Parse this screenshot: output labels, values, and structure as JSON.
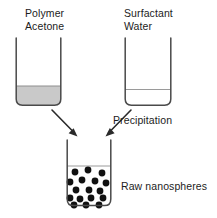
{
  "diagram": {
    "type": "process-schematic",
    "background_color": "#ffffff",
    "stroke_color": "#3a3a3a",
    "labels": {
      "left_beaker_line1": "Polymer",
      "left_beaker_line2": "Acetone",
      "right_beaker_line1": "Surfactant",
      "right_beaker_line2": "Water",
      "process_step": "Precipitation",
      "product": "Raw nanospheres"
    },
    "beakers": [
      {
        "name": "left-beaker",
        "contents_label": "Polymer Acetone",
        "x": 15,
        "y": 38,
        "width": 47,
        "height": 68,
        "corner_radius": 7,
        "liquid_level_y": 86,
        "liquid_fill_color": "#c9c9c9",
        "liquid_filled": true
      },
      {
        "name": "right-beaker",
        "contents_label": "Surfactant Water",
        "x": 124,
        "y": 38,
        "width": 48,
        "height": 68,
        "corner_radius": 7,
        "liquid_level_y": 89,
        "liquid_fill_color": "#ffffff",
        "liquid_filled": false
      },
      {
        "name": "product-beaker",
        "contents_label": "Raw nanospheres",
        "x": 66,
        "y": 140,
        "width": 45,
        "height": 66,
        "corner_radius": 7,
        "liquid_level_y": 166,
        "liquid_fill_color": "#ffffff",
        "liquid_filled": false
      }
    ],
    "arrows": [
      {
        "name": "arrow-left-to-product",
        "from_x": 52,
        "from_y": 110,
        "to_x": 76,
        "to_y": 135,
        "direction": "down-right"
      },
      {
        "name": "arrow-right-to-product",
        "from_x": 131,
        "from_y": 110,
        "to_x": 106,
        "to_y": 135,
        "direction": "down-left"
      }
    ],
    "nanospheres": {
      "name": "nanosphere-particles",
      "count": 17,
      "color": "#111111",
      "radius": 3.4,
      "points": [
        [
          75,
          172
        ],
        [
          88,
          170
        ],
        [
          102,
          173
        ],
        [
          70,
          182
        ],
        [
          82,
          180
        ],
        [
          95,
          181
        ],
        [
          106,
          183
        ],
        [
          76,
          190
        ],
        [
          89,
          190
        ],
        [
          100,
          191
        ],
        [
          70,
          198
        ],
        [
          80,
          199
        ],
        [
          91,
          198
        ],
        [
          103,
          198
        ],
        [
          74,
          205
        ],
        [
          86,
          205
        ],
        [
          99,
          205
        ]
      ]
    }
  }
}
